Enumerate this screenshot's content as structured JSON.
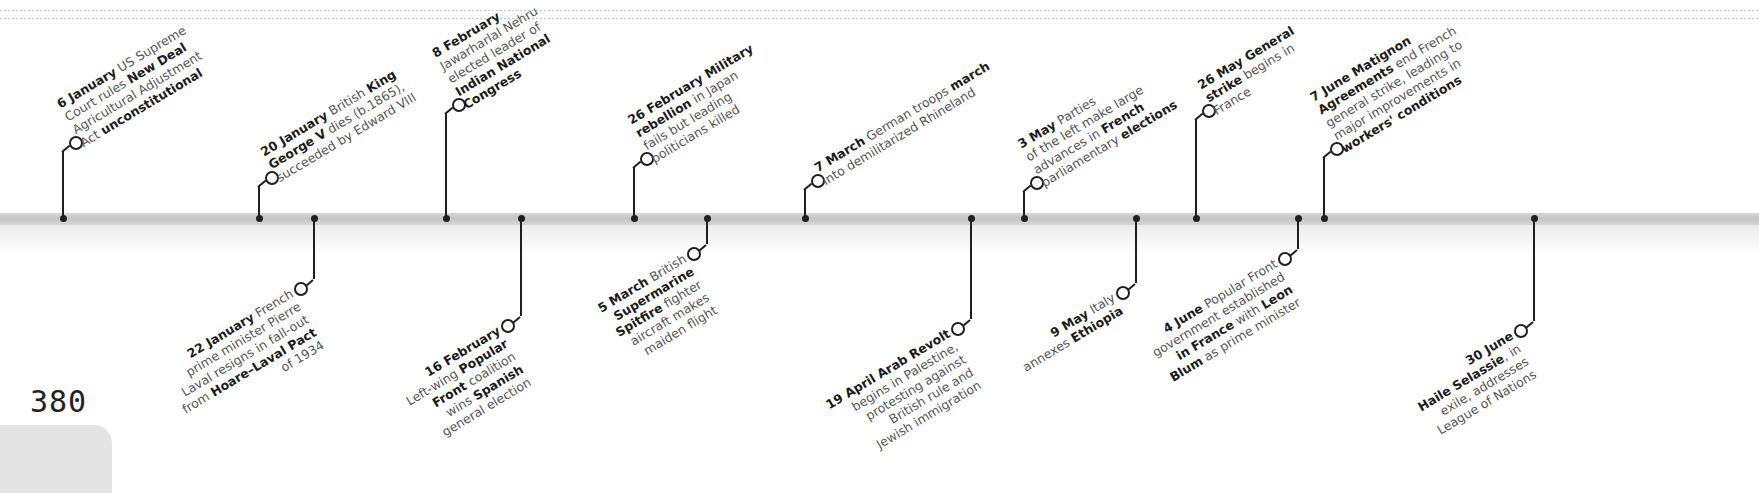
{
  "page": {
    "number": "380"
  },
  "timeline": {
    "band_color": "#c8c8c8",
    "line_color": "#1f1f1f",
    "events_above": [
      {
        "id": "6-january",
        "x": 63,
        "ring_y": 142,
        "lines": [
          [
            {
              "t": "6 January",
              "b": true
            },
            {
              "t": " US Supreme",
              "b": false
            }
          ],
          [
            {
              "t": "Court rules ",
              "b": false
            },
            {
              "t": "New Deal",
              "b": true
            }
          ],
          [
            {
              "t": "Agricultural Adjustment",
              "b": false
            }
          ],
          [
            {
              "t": "Act ",
              "b": false
            },
            {
              "t": "unconstitutional",
              "b": true
            }
          ]
        ]
      },
      {
        "id": "20-january",
        "x": 259,
        "ring_y": 177,
        "lines": [
          [
            {
              "t": "20 January",
              "b": true
            },
            {
              "t": " British ",
              "b": false
            },
            {
              "t": "King",
              "b": true
            }
          ],
          [
            {
              "t": "George V",
              "b": true
            },
            {
              "t": " dies (b.1865),",
              "b": false
            }
          ],
          [
            {
              "t": "succeeded by Edward VIII",
              "b": false
            }
          ]
        ]
      },
      {
        "id": "8-february",
        "x": 446,
        "ring_y": 104,
        "lines": [
          [
            {
              "t": "8 February",
              "b": true
            }
          ],
          [
            {
              "t": "Jawarharlal Nehru",
              "b": false
            }
          ],
          [
            {
              "t": "elected leader of",
              "b": false
            }
          ],
          [
            {
              "t": "Indian National",
              "b": true
            }
          ],
          [
            {
              "t": "Congress",
              "b": true
            }
          ]
        ]
      },
      {
        "id": "26-february",
        "x": 634,
        "ring_y": 158,
        "lines": [
          [
            {
              "t": "26 February",
              "b": true
            },
            {
              "t": " Military",
              "b": true
            }
          ],
          [
            {
              "t": "rebellion",
              "b": true
            },
            {
              "t": " in Japan",
              "b": false
            }
          ],
          [
            {
              "t": "fails but leading",
              "b": false
            }
          ],
          [
            {
              "t": "politicians killed",
              "b": false
            }
          ]
        ]
      },
      {
        "id": "7-march",
        "x": 805,
        "ring_y": 180,
        "lines": [
          [
            {
              "t": "7 March",
              "b": true
            },
            {
              "t": " German troops ",
              "b": false
            },
            {
              "t": "march",
              "b": true
            }
          ],
          [
            {
              "t": "into demilitarized Rhineland",
              "b": false
            }
          ]
        ]
      },
      {
        "id": "3-may",
        "x": 1024,
        "ring_y": 182,
        "lines": [
          [
            {
              "t": "3 May",
              "b": true
            },
            {
              "t": " Parties",
              "b": false
            }
          ],
          [
            {
              "t": "of the left make large",
              "b": false
            }
          ],
          [
            {
              "t": "advances in ",
              "b": false
            },
            {
              "t": "French",
              "b": true
            }
          ],
          [
            {
              "t": "parliamentary ",
              "b": false
            },
            {
              "t": "elections",
              "b": true
            }
          ]
        ]
      },
      {
        "id": "26-may",
        "x": 1196,
        "ring_y": 110,
        "lines": [
          [
            {
              "t": "26 May",
              "b": true
            },
            {
              "t": " General",
              "b": true
            }
          ],
          [
            {
              "t": "strike",
              "b": true
            },
            {
              "t": " begins in",
              "b": false
            }
          ],
          [
            {
              "t": "France",
              "b": false
            }
          ]
        ]
      },
      {
        "id": "7-june",
        "x": 1324,
        "ring_y": 148,
        "lines": [
          [
            {
              "t": "7 June",
              "b": true
            },
            {
              "t": " Matignon",
              "b": true
            }
          ],
          [
            {
              "t": "Agreements",
              "b": true
            },
            {
              "t": " end French",
              "b": false
            }
          ],
          [
            {
              "t": "general strike, leading to",
              "b": false
            }
          ],
          [
            {
              "t": "major improvements in",
              "b": false
            }
          ],
          [
            {
              "t": "workers' conditions",
              "b": true
            }
          ]
        ]
      }
    ],
    "events_below": [
      {
        "id": "22-january",
        "x": 314,
        "ring_y": 288,
        "lines": [
          [
            {
              "t": "22 January",
              "b": true
            },
            {
              "t": " French",
              "b": false
            }
          ],
          [
            {
              "t": "prime minister Pierre",
              "b": false
            }
          ],
          [
            {
              "t": "Laval resigns in fall-out",
              "b": false
            }
          ],
          [
            {
              "t": "from ",
              "b": false
            },
            {
              "t": "Hoare–Laval Pact",
              "b": true
            }
          ],
          [
            {
              "t": "of 1934",
              "b": false
            }
          ]
        ]
      },
      {
        "id": "16-february",
        "x": 521,
        "ring_y": 325,
        "lines": [
          [
            {
              "t": "16 February",
              "b": true
            }
          ],
          [
            {
              "t": "Left-wing ",
              "b": false
            },
            {
              "t": "Popular",
              "b": true
            }
          ],
          [
            {
              "t": "Front",
              "b": true
            },
            {
              "t": " coalition",
              "b": false
            }
          ],
          [
            {
              "t": "wins ",
              "b": false
            },
            {
              "t": "Spanish",
              "b": true
            }
          ],
          [
            {
              "t": "general election",
              "b": false
            }
          ]
        ]
      },
      {
        "id": "5-march",
        "x": 707,
        "ring_y": 253,
        "lines": [
          [
            {
              "t": "5 March",
              "b": true
            },
            {
              "t": " British",
              "b": false
            }
          ],
          [
            {
              "t": "Supermarine",
              "b": true
            }
          ],
          [
            {
              "t": "Spitfire",
              "b": true
            },
            {
              "t": " fighter",
              "b": false
            }
          ],
          [
            {
              "t": "aircraft makes",
              "b": false
            }
          ],
          [
            {
              "t": "maiden flight",
              "b": false
            }
          ]
        ]
      },
      {
        "id": "19-april",
        "x": 971,
        "ring_y": 328,
        "lines": [
          [
            {
              "t": "19 April",
              "b": true
            },
            {
              "t": " Arab Revolt",
              "b": true
            }
          ],
          [
            {
              "t": "begins in Palestine,",
              "b": false
            }
          ],
          [
            {
              "t": "protesting against",
              "b": false
            }
          ],
          [
            {
              "t": "British rule and",
              "b": false
            }
          ],
          [
            {
              "t": "Jewish immigration",
              "b": false
            }
          ]
        ]
      },
      {
        "id": "9-may",
        "x": 1136,
        "ring_y": 292,
        "lines": [
          [
            {
              "t": "9 May",
              "b": true
            },
            {
              "t": " Italy",
              "b": false
            }
          ],
          [
            {
              "t": "annexes ",
              "b": false
            },
            {
              "t": "Ethiopia",
              "b": true
            }
          ]
        ]
      },
      {
        "id": "4-june",
        "x": 1298,
        "ring_y": 258,
        "lines": [
          [
            {
              "t": "4 June",
              "b": true
            },
            {
              "t": " Popular Front",
              "b": false
            }
          ],
          [
            {
              "t": "government established",
              "b": false
            }
          ],
          [
            {
              "t": "in France",
              "b": true
            },
            {
              "t": " with ",
              "b": false
            },
            {
              "t": "Leon",
              "b": true
            }
          ],
          [
            {
              "t": "Blum",
              "b": true
            },
            {
              "t": " as prime minister",
              "b": false
            }
          ]
        ]
      },
      {
        "id": "30-june",
        "x": 1534,
        "ring_y": 330,
        "lines": [
          [
            {
              "t": "30 June",
              "b": true
            }
          ],
          [
            {
              "t": "Haile Selassie",
              "b": true
            },
            {
              "t": ", in",
              "b": false
            }
          ],
          [
            {
              "t": "exile, addresses",
              "b": false
            }
          ],
          [
            {
              "t": "League of Nations",
              "b": false
            }
          ]
        ]
      }
    ]
  }
}
